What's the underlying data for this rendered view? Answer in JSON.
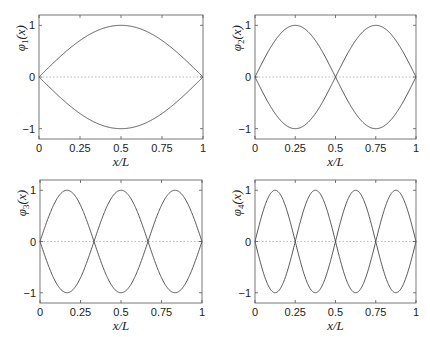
{
  "chart_data": [
    {
      "type": "line",
      "title": "",
      "xlabel": "x/L",
      "ylabel": "φ1(x)",
      "mode": 1,
      "xlim": [
        0,
        1
      ],
      "ylim": [
        -1.2,
        1.2
      ],
      "xticks": [
        "0",
        "0.25",
        "0.5",
        "0.75",
        "1"
      ],
      "yticks": [
        "1",
        "0",
        "-1"
      ],
      "series": [
        {
          "name": "+sin(1πx/L)",
          "function": "sin(pi*x)"
        },
        {
          "name": "-sin(1πx/L)",
          "function": "-sin(pi*x)"
        },
        {
          "name": "zero line",
          "style": "dotted",
          "values": [
            0,
            0
          ]
        }
      ],
      "grid": false
    },
    {
      "type": "line",
      "title": "",
      "xlabel": "x/L",
      "ylabel": "φ2(x)",
      "mode": 2,
      "xlim": [
        0,
        1
      ],
      "ylim": [
        -1.2,
        1.2
      ],
      "xticks": [
        "0",
        "0.25",
        "0.5",
        "0.75",
        "1"
      ],
      "yticks": [
        "1",
        "0",
        "-1"
      ],
      "series": [
        {
          "name": "+sin(2πx/L)",
          "function": "sin(2*pi*x)"
        },
        {
          "name": "-sin(2πx/L)",
          "function": "-sin(2*pi*x)"
        },
        {
          "name": "zero line",
          "style": "dotted",
          "values": [
            0,
            0
          ]
        }
      ],
      "grid": false
    },
    {
      "type": "line",
      "title": "",
      "xlabel": "x/L",
      "ylabel": "φ3(x)",
      "mode": 3,
      "xlim": [
        0,
        1
      ],
      "ylim": [
        -1.2,
        1.2
      ],
      "xticks": [
        "0",
        "0.25",
        "0.5",
        "0.75",
        "1"
      ],
      "yticks": [
        "1",
        "0",
        "-1"
      ],
      "series": [
        {
          "name": "+sin(3πx/L)",
          "function": "sin(3*pi*x)"
        },
        {
          "name": "-sin(3πx/L)",
          "function": "-sin(3*pi*x)"
        },
        {
          "name": "zero line",
          "style": "dotted",
          "values": [
            0,
            0
          ]
        }
      ],
      "grid": false
    },
    {
      "type": "line",
      "title": "",
      "xlabel": "x/L",
      "ylabel": "φ4(x)",
      "mode": 4,
      "xlim": [
        0,
        1
      ],
      "ylim": [
        -1.2,
        1.2
      ],
      "xticks": [
        "0",
        "0.25",
        "0.5",
        "0.75",
        "1"
      ],
      "yticks": [
        "1",
        "0",
        "-1"
      ],
      "series": [
        {
          "name": "+sin(4πx/L)",
          "function": "sin(4*pi*x)"
        },
        {
          "name": "-sin(4πx/L)",
          "function": "-sin(4*pi*x)"
        },
        {
          "name": "zero line",
          "style": "dotted",
          "values": [
            0,
            0
          ]
        }
      ],
      "grid": false
    }
  ],
  "panels": [
    {
      "ylabel_base": "φ",
      "ylabel_sub": "1",
      "ylabel_tail": "(x)",
      "xlabel": "x/L"
    },
    {
      "ylabel_base": "φ",
      "ylabel_sub": "2",
      "ylabel_tail": "(x)",
      "xlabel": "x/L"
    },
    {
      "ylabel_base": "φ",
      "ylabel_sub": "3",
      "ylabel_tail": "(x)",
      "xlabel": "x/L"
    },
    {
      "ylabel_base": "φ",
      "ylabel_sub": "4",
      "ylabel_tail": "(x)",
      "xlabel": "x/L"
    }
  ],
  "ticks": {
    "x": [
      "0",
      "0.25",
      "0.5",
      "0.75",
      "1"
    ],
    "y": [
      "1",
      "0",
      "−1"
    ]
  },
  "colors": {
    "curve": "#444444",
    "axes": "#555555",
    "zero_line": "#bbbbbb"
  }
}
